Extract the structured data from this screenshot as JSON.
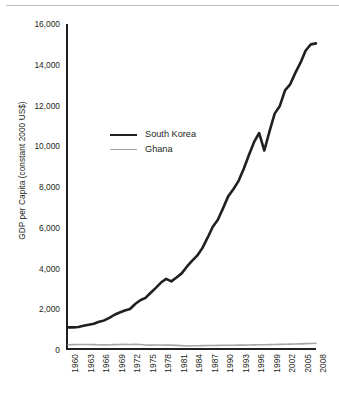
{
  "chart_data": {
    "type": "line",
    "title": "",
    "xlabel": "",
    "ylabel": "GDP per Capita (constant 2000 US$)",
    "xlim": [
      1960,
      2008
    ],
    "ylim": [
      0,
      16000
    ],
    "grid": false,
    "legend_position": "inside-upper-left",
    "y_ticks": [
      "0",
      "2,000",
      "4,000",
      "6,000",
      "8,000",
      "10,000",
      "12,000",
      "14,000",
      "16,000"
    ],
    "y_tick_values": [
      0,
      2000,
      4000,
      6000,
      8000,
      10000,
      12000,
      14000,
      16000
    ],
    "x_ticks": [
      "1960",
      "1963",
      "1966",
      "1969",
      "1972",
      "1975",
      "1978",
      "1981",
      "1984",
      "1987",
      "1990",
      "1993",
      "1996",
      "1999",
      "2002",
      "2005",
      "2008"
    ],
    "x": [
      1960,
      1961,
      1962,
      1963,
      1964,
      1965,
      1966,
      1967,
      1968,
      1969,
      1970,
      1971,
      1972,
      1973,
      1974,
      1975,
      1976,
      1977,
      1978,
      1979,
      1980,
      1981,
      1982,
      1983,
      1984,
      1985,
      1986,
      1987,
      1988,
      1989,
      1990,
      1991,
      1992,
      1993,
      1994,
      1995,
      1996,
      1997,
      1998,
      1999,
      2000,
      2001,
      2002,
      2003,
      2004,
      2005,
      2006,
      2007,
      2008
    ],
    "series": [
      {
        "name": "South Korea",
        "color": "#231f20",
        "width": 2.6,
        "values": [
          1110,
          1110,
          1130,
          1190,
          1240,
          1290,
          1390,
          1450,
          1580,
          1730,
          1840,
          1940,
          2010,
          2260,
          2440,
          2560,
          2810,
          3050,
          3310,
          3490,
          3370,
          3560,
          3760,
          4090,
          4370,
          4630,
          5000,
          5500,
          6040,
          6390,
          6950,
          7540,
          7890,
          8290,
          8880,
          9560,
          10200,
          10650,
          9790,
          10730,
          11600,
          11980,
          12740,
          13040,
          13600,
          14100,
          14700,
          15000,
          15050
        ]
      },
      {
        "name": "Ghana",
        "color": "#a6a6a6",
        "width": 1.6,
        "values": [
          260,
          265,
          270,
          272,
          268,
          265,
          255,
          252,
          256,
          262,
          272,
          276,
          272,
          274,
          268,
          248,
          240,
          243,
          249,
          240,
          238,
          228,
          215,
          200,
          208,
          212,
          214,
          218,
          222,
          226,
          230,
          233,
          236,
          239,
          241,
          245,
          250,
          255,
          261,
          266,
          272,
          276,
          281,
          288,
          295,
          303,
          311,
          320,
          330
        ]
      }
    ]
  },
  "legend": {
    "items": [
      {
        "label": "South Korea"
      },
      {
        "label": "Ghana"
      }
    ]
  }
}
